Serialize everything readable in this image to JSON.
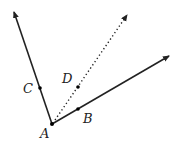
{
  "diagram": {
    "points": {
      "A": {
        "label": "A",
        "x": 52,
        "y": 124
      },
      "B": {
        "label": "B",
        "x": 78,
        "y": 109
      },
      "C": {
        "label": "C",
        "x": 40,
        "y": 88
      },
      "D": {
        "label": "D",
        "x": 78,
        "y": 87
      }
    },
    "rays": [
      {
        "name": "ray-AC",
        "from": "A",
        "tip": [
          13,
          10
        ],
        "style": "solid"
      },
      {
        "name": "ray-AB",
        "from": "A",
        "tip": [
          171,
          55
        ],
        "style": "solid"
      },
      {
        "name": "ray-AD",
        "from": "A",
        "tip": [
          128,
          13
        ],
        "style": "dotted"
      }
    ],
    "colors": {
      "stroke": "#222222",
      "background": "#ffffff"
    }
  }
}
